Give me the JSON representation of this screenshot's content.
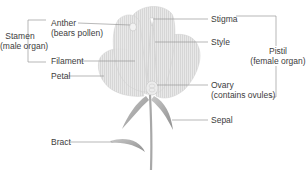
{
  "diagram": {
    "groups": {
      "stamen": {
        "line1": "Stamen",
        "line2": "(male organ)"
      },
      "pistil": {
        "line1": "Pistil",
        "line2": "(female organ)"
      }
    },
    "labels": {
      "anther": {
        "line1": "Anther",
        "line2": "(bears pollen)"
      },
      "filament": "Filament",
      "petal": "Petal",
      "stigma": "Stigma",
      "style": "Style",
      "ovary": {
        "line1": "Ovary",
        "line2": "(contains ovules)"
      },
      "sepal": "Sepal",
      "bract": "Bract"
    },
    "colors": {
      "leader_line": "#9a9a9a",
      "petal_fill": "#e6e6e6",
      "petal_stroke": "#c4c4c4",
      "stem": "#a9a9a9",
      "text": "#3c3c3c"
    }
  }
}
